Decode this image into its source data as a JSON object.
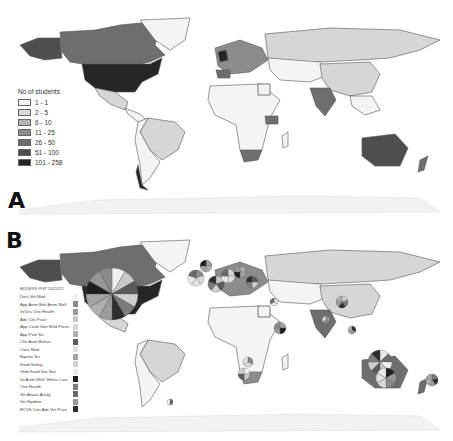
{
  "figure": {
    "panels": [
      {
        "label": "A",
        "type": "choropleth",
        "legend": {
          "title": "No of students",
          "classes": [
            {
              "range": "1 - 1",
              "color": "#f4f4f4"
            },
            {
              "range": "2 - 5",
              "color": "#d6d6d6"
            },
            {
              "range": "6 - 10",
              "color": "#b4b4b4"
            },
            {
              "range": "11 - 25",
              "color": "#8c8c8c"
            },
            {
              "range": "26 - 50",
              "color": "#6e6e6e"
            },
            {
              "range": "51 - 100",
              "color": "#4e4e4e"
            },
            {
              "range": "101 - 258",
              "color": "#262626"
            }
          ]
        }
      },
      {
        "label": "B",
        "type": "pie-chart-map",
        "legend": {
          "title": "R(D)SVS PGT 2021/22",
          "title_marker": "·",
          "items": [
            {
              "label": "Dost Vet Med",
              "color": "#f0f0f0"
            },
            {
              "label": "App Anim Beh Anim Welf",
              "color": "#8a8a8a"
            },
            {
              "label": "Inf Dis One Health",
              "color": "#9c9c9c"
            },
            {
              "label": "Adv Clin Pract",
              "color": "#c8c8c8"
            },
            {
              "label": "App Conb Gen Wild Prevn",
              "color": "#d8d8d8"
            },
            {
              "label": "App Poul Sci",
              "color": "#b0b0b0"
            },
            {
              "label": "Clin Anim Behav",
              "color": "#5a5a5a"
            },
            {
              "label": "Cons Med",
              "color": "#e0e0e0"
            },
            {
              "label": "Equine Sci",
              "color": "#a4a4a4"
            },
            {
              "label": "Food Safety",
              "color": "#cfcfcf"
            },
            {
              "label": "Glob Food Sec Nut",
              "color": "#e8e8e8"
            },
            {
              "label": "Int Anim Welf, Ethics Law",
              "color": "#1e1e1e"
            },
            {
              "label": "One Health",
              "color": "#7c7c7c"
            },
            {
              "label": "Vet Anaes Analg",
              "color": "#6a6a6a"
            },
            {
              "label": "Vet Epidem",
              "color": "#989898"
            },
            {
              "label": "RCVS Cert Adv Vet Pract",
              "color": "#2e2e2e"
            }
          ]
        }
      }
    ]
  }
}
